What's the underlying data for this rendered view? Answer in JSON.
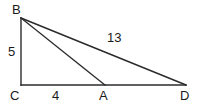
{
  "figure": {
    "kind": "geometry-diagram",
    "width": 200,
    "height": 108,
    "background_color": "#ffffff",
    "stroke_color": "#2b2b2b",
    "text_color": "#1a1a1a",
    "stroke_width": 1.4
  },
  "vertices": {
    "B": {
      "label": "B",
      "x": 21,
      "y": 18
    },
    "C": {
      "label": "C",
      "x": 21,
      "y": 85
    },
    "A": {
      "label": "A",
      "x": 105,
      "y": 85
    },
    "D": {
      "label": "D",
      "x": 186,
      "y": 85
    }
  },
  "segments": [
    {
      "name": "BC",
      "from": "B",
      "to": "C",
      "x1": 21,
      "y1": 18,
      "x2": 21,
      "y2": 85
    },
    {
      "name": "CD",
      "from": "C",
      "to": "D",
      "x1": 21,
      "y1": 85,
      "x2": 186,
      "y2": 85
    },
    {
      "name": "BA",
      "from": "B",
      "to": "A",
      "x1": 21,
      "y1": 18,
      "x2": 105,
      "y2": 85
    },
    {
      "name": "BD",
      "from": "B",
      "to": "D",
      "x1": 21,
      "y1": 18,
      "x2": 186,
      "y2": 85
    }
  ],
  "measures": {
    "BC": "5",
    "CA": "4",
    "BD": "13"
  }
}
